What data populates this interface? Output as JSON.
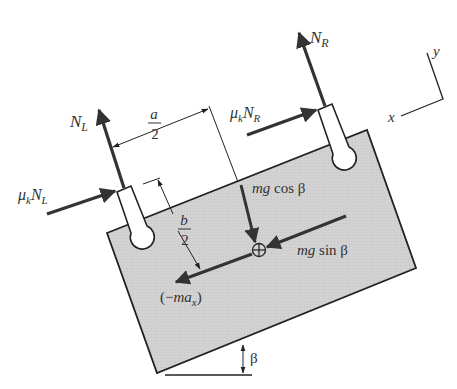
{
  "figure": {
    "type": "free-body diagram",
    "colors": {
      "body_fill": "#d2d2d2",
      "line": "#222222",
      "force_arrow": "#333333",
      "background": "#ffffff"
    },
    "labels": {
      "normal_left": {
        "main": "N",
        "sub": "L"
      },
      "normal_right": {
        "main": "N",
        "sub": "R"
      },
      "friction_left": {
        "mu": "μ",
        "k": "k",
        "main": "N",
        "sub": "L"
      },
      "friction_right": {
        "mu": "μ",
        "k": "k",
        "main": "N",
        "sub": "R"
      },
      "half_a": {
        "num": "a",
        "den": "2"
      },
      "half_b": {
        "num": "b",
        "den": "2"
      },
      "weight_normal": {
        "italic": "mg",
        "plain": " cos β"
      },
      "weight_tangent": {
        "italic": "mg",
        "plain": " sin β"
      },
      "inertial": {
        "open": "(−",
        "italic": "ma",
        "sub": "x",
        "close": ")"
      },
      "angle": "β",
      "axis_x": "x",
      "axis_y": "y"
    }
  }
}
